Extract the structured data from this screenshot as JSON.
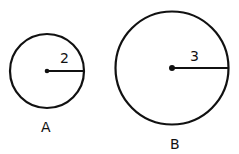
{
  "circles": [
    {
      "label": "A",
      "radius_label": "2",
      "cx": 47,
      "cy": 71,
      "r": 37
    },
    {
      "label": "B",
      "radius_label": "3",
      "cx": 172,
      "cy": 68,
      "r": 57
    }
  ],
  "colors": {
    "stroke": "#111111",
    "background": "#ffffff"
  }
}
